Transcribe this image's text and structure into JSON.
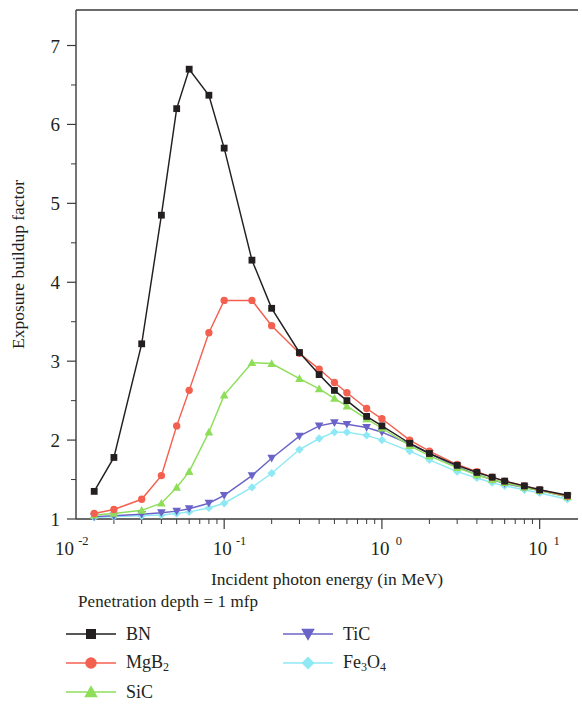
{
  "figure": {
    "background_color": "#ffffff",
    "frame_color": "#3a3a3a"
  },
  "legend": {
    "title": "Penetration depth = 1 mfp",
    "entries": [
      {
        "label": "BN",
        "label_base": "BN",
        "label_sub": "",
        "label_sub2": "",
        "color": "#231f20",
        "marker": "square",
        "column": "left"
      },
      {
        "label": "MgB2",
        "label_base": "MgB",
        "label_sub": "2",
        "label_sub2": "",
        "color": "#f4604f",
        "marker": "circle",
        "column": "left"
      },
      {
        "label": "SiC",
        "label_base": "SiC",
        "label_sub": "",
        "label_sub2": "",
        "color": "#8ede5a",
        "marker": "triangle-up",
        "column": "left"
      },
      {
        "label": "TiC",
        "label_base": "TiC",
        "label_sub": "",
        "label_sub2": "",
        "color": "#6b64c8",
        "marker": "triangle-down",
        "column": "right"
      },
      {
        "label": "Fe3O4",
        "label_base": "Fe",
        "label_sub": "3",
        "label_sub2": "O",
        "label_sub3": "4",
        "color": "#8fe9f5",
        "marker": "diamond",
        "column": "right"
      }
    ]
  },
  "chart_data": {
    "type": "line",
    "title": "",
    "xlabel": "Incident photon energy (in MeV)",
    "ylabel": "Exposure buildup factor",
    "xscale": "log",
    "yscale": "linear",
    "xlim": [
      0.0115,
      17.5
    ],
    "ylim": [
      1.0,
      7.45
    ],
    "grid": false,
    "legend_position": "below-axes",
    "x_major_ticks": [
      0.01,
      0.1,
      1,
      10
    ],
    "x_major_tick_labels": [
      "10⁻²",
      "10⁻¹",
      "10⁰",
      "10¹"
    ],
    "x_major_tick_mantissa": [
      "10",
      "10",
      "10",
      "10"
    ],
    "x_major_tick_exponent": [
      "-2",
      "-1",
      "0",
      "1"
    ],
    "y_major_ticks": [
      1,
      2,
      3,
      4,
      5,
      6,
      7
    ],
    "y_major_tick_labels": [
      "1",
      "2",
      "3",
      "4",
      "5",
      "6",
      "7"
    ],
    "y_minor_ticks": [
      1.5,
      2.5,
      3.5,
      4.5,
      5.5,
      6.5
    ],
    "x": [
      0.015,
      0.02,
      0.03,
      0.04,
      0.05,
      0.06,
      0.08,
      0.1,
      0.15,
      0.2,
      0.3,
      0.4,
      0.5,
      0.6,
      0.8,
      1.0,
      1.5,
      2.0,
      3.0,
      4.0,
      5.0,
      6.0,
      8.0,
      10.0,
      15.0
    ],
    "series": [
      {
        "name": "BN",
        "color": "#231f20",
        "marker": "square",
        "values": [
          1.35,
          1.78,
          3.22,
          4.85,
          6.2,
          6.7,
          6.37,
          5.7,
          4.28,
          3.67,
          3.11,
          2.83,
          2.63,
          2.5,
          2.3,
          2.18,
          1.96,
          1.83,
          1.68,
          1.59,
          1.53,
          1.48,
          1.42,
          1.37,
          1.3
        ]
      },
      {
        "name": "MgB2",
        "color": "#f4604f",
        "marker": "circle",
        "values": [
          1.07,
          1.12,
          1.25,
          1.55,
          2.18,
          2.63,
          3.36,
          3.77,
          3.77,
          3.45,
          3.1,
          2.9,
          2.73,
          2.6,
          2.4,
          2.27,
          2.0,
          1.86,
          1.69,
          1.6,
          1.53,
          1.48,
          1.42,
          1.37,
          1.29
        ]
      },
      {
        "name": "SiC",
        "color": "#8ede5a",
        "marker": "triangle-up",
        "values": [
          1.05,
          1.07,
          1.11,
          1.2,
          1.4,
          1.6,
          2.1,
          2.57,
          2.98,
          2.97,
          2.78,
          2.65,
          2.53,
          2.43,
          2.27,
          2.15,
          1.93,
          1.8,
          1.65,
          1.56,
          1.5,
          1.46,
          1.4,
          1.36,
          1.28
        ]
      },
      {
        "name": "TiC",
        "color": "#6b64c8",
        "marker": "triangle-down",
        "values": [
          1.03,
          1.04,
          1.06,
          1.08,
          1.1,
          1.13,
          1.2,
          1.3,
          1.55,
          1.77,
          2.05,
          2.18,
          2.22,
          2.2,
          2.16,
          2.1,
          1.95,
          1.83,
          1.66,
          1.56,
          1.5,
          1.45,
          1.4,
          1.36,
          1.28
        ]
      },
      {
        "name": "Fe3O4",
        "color": "#8fe9f5",
        "marker": "diamond",
        "values": [
          1.02,
          1.03,
          1.04,
          1.05,
          1.07,
          1.09,
          1.14,
          1.2,
          1.4,
          1.58,
          1.88,
          2.02,
          2.1,
          2.1,
          2.06,
          2.0,
          1.86,
          1.75,
          1.6,
          1.52,
          1.46,
          1.42,
          1.37,
          1.33,
          1.25
        ]
      }
    ]
  }
}
